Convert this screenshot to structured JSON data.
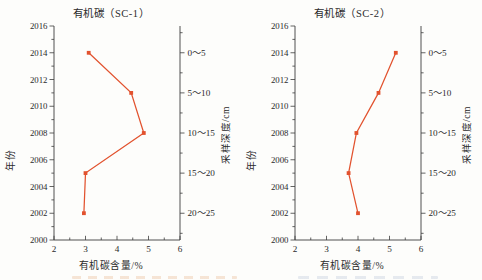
{
  "figure": {
    "background": "#fdfdfb",
    "text_color": "#2b2b2b",
    "axis_color": "#3c3c3c",
    "accent_color": "#e2522e"
  },
  "chart_data": [
    {
      "type": "line",
      "title": "有机碳（SC-1）",
      "xlabel": "有机碳含量/%",
      "ylabel_left": "年份",
      "ylabel_right": "采样深度/cm",
      "xlim": [
        2,
        6
      ],
      "xticks": [
        2,
        3,
        4,
        5,
        6
      ],
      "x_minor_step": 0.5,
      "ylim": [
        2000,
        2016
      ],
      "yticks": [
        2000,
        2002,
        2004,
        2006,
        2008,
        2010,
        2012,
        2014,
        2016
      ],
      "grid": false,
      "legend": null,
      "series": [
        {
          "name": "有机碳含量",
          "points": [
            {
              "year": 2002,
              "depth": "20～25",
              "value": 2.95
            },
            {
              "year": 2005,
              "depth": "15～20",
              "value": 3.0
            },
            {
              "year": 2008,
              "depth": "10～15",
              "value": 4.85
            },
            {
              "year": 2011,
              "depth": "5～10",
              "value": 4.45
            },
            {
              "year": 2014,
              "depth": "0～5",
              "value": 3.1
            }
          ]
        }
      ],
      "right_axis_labels": [
        {
          "label": "0～5",
          "year": 2014
        },
        {
          "label": "5～10",
          "year": 2011
        },
        {
          "label": "10～15",
          "year": 2008
        },
        {
          "label": "15～20",
          "year": 2005
        },
        {
          "label": "20～25",
          "year": 2002
        }
      ]
    },
    {
      "type": "line",
      "title": "有机碳（SC-2）",
      "xlabel": "有机碳含量/%",
      "ylabel_left": "年份",
      "ylabel_right": "采样深度/cm",
      "xlim": [
        2,
        6
      ],
      "xticks": [
        2,
        3,
        4,
        5,
        6
      ],
      "x_minor_step": 0.5,
      "ylim": [
        2000,
        2016
      ],
      "yticks": [
        2000,
        2002,
        2004,
        2006,
        2008,
        2010,
        2012,
        2014,
        2016
      ],
      "grid": false,
      "legend": null,
      "series": [
        {
          "name": "有机碳含量",
          "points": [
            {
              "year": 2002,
              "depth": "20～25",
              "value": 4.0
            },
            {
              "year": 2005,
              "depth": "15～20",
              "value": 3.7
            },
            {
              "year": 2008,
              "depth": "10～15",
              "value": 3.95
            },
            {
              "year": 2011,
              "depth": "5～10",
              "value": 4.65
            },
            {
              "year": 2014,
              "depth": "0～5",
              "value": 5.2
            }
          ]
        }
      ],
      "right_axis_labels": [
        {
          "label": "0～5",
          "year": 2014
        },
        {
          "label": "5～10",
          "year": 2011
        },
        {
          "label": "10～15",
          "year": 2008
        },
        {
          "label": "15～20",
          "year": 2005
        },
        {
          "label": "20～25",
          "year": 2002
        }
      ]
    }
  ],
  "footer": {
    "left_mark_color": "#edc6a6",
    "right_mark_color": "#c9d2e0"
  }
}
